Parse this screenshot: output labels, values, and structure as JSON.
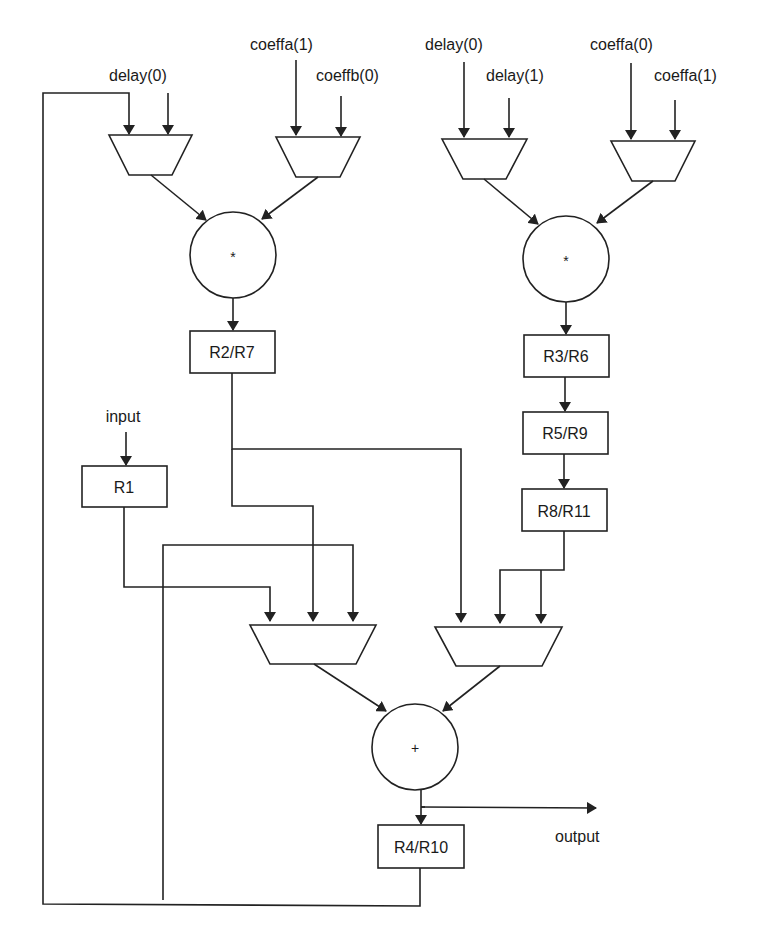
{
  "diagram": {
    "type": "datapath",
    "inputs_left_mux_a": [
      "delay(0)"
    ],
    "inputs_left_mux_b": [
      "coeffa(1)",
      "coeffb(0)"
    ],
    "inputs_right_mux_a": [
      "delay(0)",
      "delay(1)"
    ],
    "inputs_right_mux_b": [
      "coeffa(0)",
      "coeffa(1)"
    ],
    "labels": {
      "delay0_left": "delay(0)",
      "coeffa1_left": "coeffa(1)",
      "coeffb0": "coeffb(0)",
      "delay0_right": "delay(0)",
      "delay1": "delay(1)",
      "coeffa0": "coeffa(0)",
      "coeffa1_right": "coeffa(1)",
      "input": "input",
      "output": "output"
    },
    "operators": {
      "mult_left": "*",
      "mult_right": "*",
      "adder": "+"
    },
    "registers": {
      "r2r7": "R2/R7",
      "r3r6": "R3/R6",
      "r5r9": "R5/R9",
      "r8r11": "R8/R11",
      "r1": "R1",
      "r4r10": "R4/R10"
    },
    "edges": [
      [
        "delay(0)",
        "mux1"
      ],
      [
        "feedback R4/R10",
        "mux1"
      ],
      [
        "coeffa(1)",
        "mux2"
      ],
      [
        "coeffb(0)",
        "mux2"
      ],
      [
        "delay(0)",
        "mux3"
      ],
      [
        "delay(1)",
        "mux3"
      ],
      [
        "coeffa(0)",
        "mux4"
      ],
      [
        "coeffa(1)",
        "mux4"
      ],
      [
        "mux1",
        "mult_left"
      ],
      [
        "mux2",
        "mult_left"
      ],
      [
        "mux3",
        "mult_right"
      ],
      [
        "mux4",
        "mult_right"
      ],
      [
        "mult_left",
        "R2/R7"
      ],
      [
        "mult_right",
        "R3/R6"
      ],
      [
        "R3/R6",
        "R5/R9"
      ],
      [
        "R5/R9",
        "R8/R11"
      ],
      [
        "input",
        "R1"
      ],
      [
        "R1",
        "mux5"
      ],
      [
        "R2/R7",
        "mux5"
      ],
      [
        "feedback R4/R10",
        "mux5"
      ],
      [
        "R2/R7",
        "mux6"
      ],
      [
        "R8/R11",
        "mux6"
      ],
      [
        "R8/R11",
        "mux6"
      ],
      [
        "mux5",
        "adder"
      ],
      [
        "mux6",
        "adder"
      ],
      [
        "adder",
        "R4/R10"
      ],
      [
        "adder",
        "output"
      ]
    ]
  }
}
